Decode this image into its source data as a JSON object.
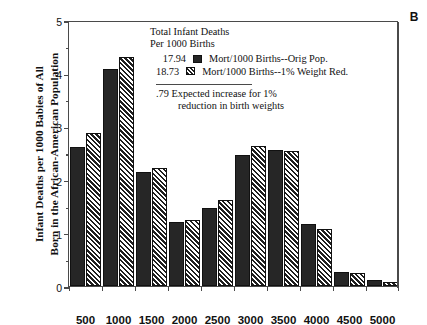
{
  "panel": {
    "letter": "B"
  },
  "axes": {
    "ylabel_line1": "Infant Deaths per 1000 Babies of All",
    "ylabel_line2": "Born in the African-American Population",
    "yticks": [
      "0",
      "1",
      "2",
      "3",
      "4",
      "5"
    ],
    "xticks": [
      "500",
      "1000",
      "1500",
      "2000",
      "2500",
      "3000",
      "3500",
      "4000",
      "4500",
      "5000"
    ]
  },
  "legend": {
    "header_line1": "Total Infant Deaths",
    "header_line2": "Per 1000 Births",
    "rows": [
      {
        "value": "17.94",
        "swatch": "solid",
        "label": "Mort/1000 Births--Orig Pop."
      },
      {
        "value": "18.73",
        "swatch": "hatch",
        "label": "Mort/1000 Births--1% Weight Red."
      }
    ],
    "note_line1": ".79 Expected increase for 1%",
    "note_line2": "reduction in birth weights"
  },
  "colors": {
    "series1": "#262626",
    "series2_hatch": "#1f1f1f",
    "axis": "#4a4a4a",
    "background": "#ffffff"
  },
  "chart_data": {
    "type": "bar",
    "title": "",
    "xlabel": "",
    "ylabel": "Infant Deaths per 1000 Babies of All Born in the African-American Population",
    "categories": [
      "500",
      "1000",
      "1500",
      "2000",
      "2500",
      "3000",
      "3500",
      "4000",
      "4500",
      "5000"
    ],
    "series": [
      {
        "name": "Mort/1000 Births--Orig Pop.",
        "total": "17.94",
        "style": "solid",
        "values": [
          2.62,
          4.08,
          2.14,
          1.2,
          1.46,
          2.46,
          2.55,
          1.17,
          0.27,
          0.12
        ]
      },
      {
        "name": "Mort/1000 Births--1% Weight Red.",
        "total": "18.73",
        "style": "hatched",
        "values": [
          2.87,
          4.3,
          2.21,
          1.25,
          1.62,
          2.63,
          2.54,
          1.08,
          0.25,
          0.07
        ]
      }
    ],
    "ylim": [
      0,
      5
    ],
    "ytick_values": [
      0,
      1,
      2,
      3,
      4,
      5
    ],
    "yminor_step": 0.5,
    "grid": false,
    "legend_position": "upper-center",
    "annotation": ".79 Expected increase for 1% reduction in birth weights"
  }
}
